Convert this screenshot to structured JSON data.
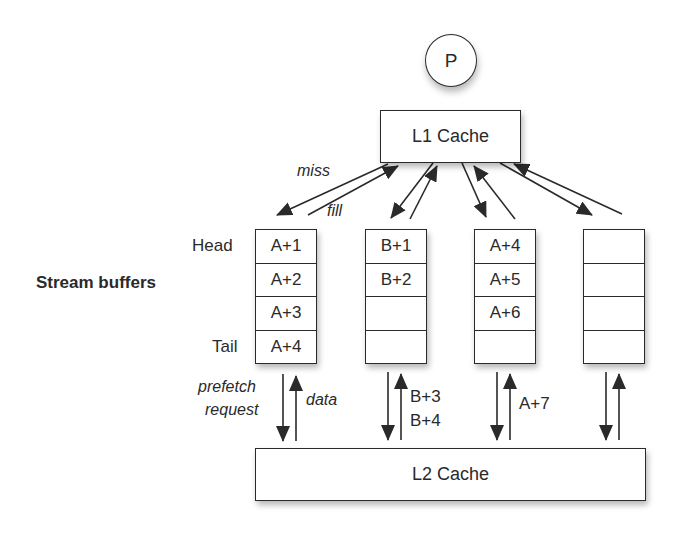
{
  "processor": {
    "label": "P"
  },
  "l1_cache": {
    "label": "L1 Cache"
  },
  "l2_cache": {
    "label": "L2 Cache"
  },
  "side_label": "Stream buffers",
  "position_labels": {
    "head": "Head",
    "tail": "Tail"
  },
  "arrow_labels": {
    "miss": "miss",
    "fill": "fill",
    "prefetch_line1": "prefetch",
    "prefetch_line2": "request",
    "data": "data",
    "b_prefetch_1": "B+3",
    "b_prefetch_2": "B+4",
    "a_prefetch": "A+7"
  },
  "stream_buffers": [
    {
      "entries": [
        "A+1",
        "A+2",
        "A+3",
        "A+4"
      ]
    },
    {
      "entries": [
        "B+1",
        "B+2",
        "",
        ""
      ]
    },
    {
      "entries": [
        "A+4",
        "A+5",
        "A+6",
        ""
      ]
    },
    {
      "entries": [
        "",
        "",
        "",
        ""
      ]
    }
  ],
  "colors": {
    "stroke": "#2a2a2a",
    "background": "#ffffff"
  }
}
